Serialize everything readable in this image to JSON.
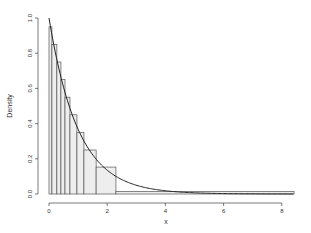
{
  "chart_data": {
    "type": "bar",
    "subtype": "histogram-with-density-curve",
    "title": "",
    "xlabel": "x",
    "ylabel": "Density",
    "xlim": [
      0,
      8.5
    ],
    "ylim": [
      0,
      1.0
    ],
    "x_ticks": [
      0,
      2,
      4,
      6,
      8
    ],
    "x_tick_labels": [
      "0",
      "2",
      "4",
      "6",
      "8"
    ],
    "y_ticks": [
      0.0,
      0.2,
      0.4,
      0.6,
      0.8,
      1.0
    ],
    "y_tick_labels": [
      "0.0",
      "0.2",
      "0.4",
      "0.6",
      "0.8",
      "1.0"
    ],
    "grid": false,
    "legend": null,
    "bins": [
      {
        "x0": 0.0,
        "x1": 0.1,
        "density": 0.95
      },
      {
        "x0": 0.1,
        "x1": 0.27,
        "density": 0.85
      },
      {
        "x0": 0.27,
        "x1": 0.41,
        "density": 0.75
      },
      {
        "x0": 0.41,
        "x1": 0.55,
        "density": 0.65
      },
      {
        "x0": 0.55,
        "x1": 0.72,
        "density": 0.55
      },
      {
        "x0": 0.72,
        "x1": 0.96,
        "density": 0.45
      },
      {
        "x0": 0.96,
        "x1": 1.2,
        "density": 0.35
      },
      {
        "x0": 1.2,
        "x1": 1.62,
        "density": 0.25
      },
      {
        "x0": 1.62,
        "x1": 2.3,
        "density": 0.153
      },
      {
        "x0": 2.3,
        "x1": 8.42,
        "density": 0.015
      }
    ],
    "curve": {
      "name": "exponential density",
      "formula": "exp(-x)",
      "x_range": [
        0,
        8.4
      ]
    },
    "colors": {
      "bar_fill": "#eeeeee",
      "bar_stroke": "#555555",
      "curve": "#222222",
      "axis": "#444444"
    }
  }
}
